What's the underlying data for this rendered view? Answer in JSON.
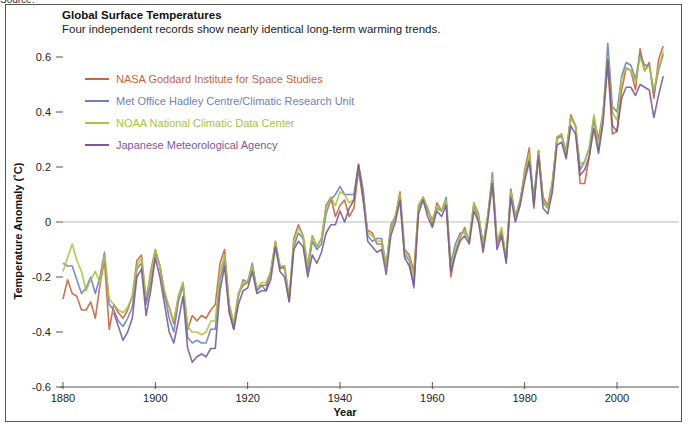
{
  "header": {
    "source_label": "Source:",
    "title": "Global Surface Temperatures",
    "subtitle": "Four independent records show nearly identical long-term warming trends."
  },
  "axes": {
    "xlabel": "Year",
    "ylabel": "Temperature Anomaly (˚C)"
  },
  "chart_data": {
    "type": "line",
    "title": "Global Surface Temperatures",
    "subtitle": "Four independent records show nearly identical long-term warming trends.",
    "xlabel": "Year",
    "ylabel": "Temperature Anomaly (˚C)",
    "xlim": [
      1880,
      2010
    ],
    "ylim": [
      -0.6,
      0.65
    ],
    "x_ticks": [
      1880,
      1900,
      1920,
      1940,
      1960,
      1980,
      2000
    ],
    "y_ticks": [
      -0.6,
      -0.4,
      -0.2,
      0,
      0.2,
      0.4,
      0.6
    ],
    "y_tick_labels": [
      "-0.6",
      "-0.4",
      "-0.2",
      "0",
      "0.2",
      "0.4",
      "0.6"
    ],
    "grid": false,
    "zero_line": true,
    "legend_position": "upper-left",
    "x": [
      1880,
      1881,
      1882,
      1883,
      1884,
      1885,
      1886,
      1887,
      1888,
      1889,
      1890,
      1891,
      1892,
      1893,
      1894,
      1895,
      1896,
      1897,
      1898,
      1899,
      1900,
      1901,
      1902,
      1903,
      1904,
      1905,
      1906,
      1907,
      1908,
      1909,
      1910,
      1911,
      1912,
      1913,
      1914,
      1915,
      1916,
      1917,
      1918,
      1919,
      1920,
      1921,
      1922,
      1923,
      1924,
      1925,
      1926,
      1927,
      1928,
      1929,
      1930,
      1931,
      1932,
      1933,
      1934,
      1935,
      1936,
      1937,
      1938,
      1939,
      1940,
      1941,
      1942,
      1943,
      1944,
      1945,
      1946,
      1947,
      1948,
      1949,
      1950,
      1951,
      1952,
      1953,
      1954,
      1955,
      1956,
      1957,
      1958,
      1959,
      1960,
      1961,
      1962,
      1963,
      1964,
      1965,
      1966,
      1967,
      1968,
      1969,
      1970,
      1971,
      1972,
      1973,
      1974,
      1975,
      1976,
      1977,
      1978,
      1979,
      1980,
      1981,
      1982,
      1983,
      1984,
      1985,
      1986,
      1987,
      1988,
      1989,
      1990,
      1991,
      1992,
      1993,
      1994,
      1995,
      1996,
      1997,
      1998,
      1999,
      2000,
      2001,
      2002,
      2003,
      2004,
      2005,
      2006,
      2007,
      2008,
      2009,
      2010
    ],
    "series": [
      {
        "name": "NASA Goddard Institute for Space Studies",
        "color": "#c8643c",
        "values": [
          -0.28,
          -0.21,
          -0.26,
          -0.27,
          -0.32,
          -0.32,
          -0.29,
          -0.35,
          -0.23,
          -0.14,
          -0.39,
          -0.3,
          -0.33,
          -0.35,
          -0.32,
          -0.27,
          -0.14,
          -0.12,
          -0.29,
          -0.18,
          -0.1,
          -0.16,
          -0.27,
          -0.31,
          -0.37,
          -0.27,
          -0.22,
          -0.39,
          -0.34,
          -0.36,
          -0.34,
          -0.35,
          -0.32,
          -0.3,
          -0.15,
          -0.1,
          -0.3,
          -0.37,
          -0.26,
          -0.23,
          -0.22,
          -0.16,
          -0.25,
          -0.23,
          -0.23,
          -0.18,
          -0.07,
          -0.17,
          -0.16,
          -0.28,
          -0.06,
          -0.01,
          -0.05,
          -0.16,
          -0.05,
          -0.09,
          -0.06,
          0.06,
          0.09,
          0.02,
          0.06,
          0.08,
          0.02,
          0.05,
          0.19,
          0.08,
          -0.03,
          -0.04,
          -0.08,
          -0.08,
          -0.16,
          -0.03,
          0.02,
          0.11,
          -0.1,
          -0.12,
          -0.18,
          0.06,
          0.09,
          0.05,
          -0.01,
          0.07,
          0.04,
          0.07,
          -0.2,
          -0.11,
          -0.06,
          -0.02,
          -0.07,
          0.07,
          0.03,
          -0.09,
          0.02,
          0.15,
          -0.08,
          -0.04,
          -0.13,
          0.12,
          0.02,
          0.06,
          0.19,
          0.27,
          0.05,
          0.26,
          0.09,
          0.06,
          0.15,
          0.3,
          0.32,
          0.24,
          0.39,
          0.35,
          0.14,
          0.14,
          0.24,
          0.38,
          0.3,
          0.4,
          0.57,
          0.32,
          0.33,
          0.48,
          0.56,
          0.55,
          0.48,
          0.63,
          0.55,
          0.58,
          0.45,
          0.59,
          0.64
        ]
      },
      {
        "name": "Met Office Hadley Centre/Climatic Research Unit",
        "color": "#6e7fc0",
        "values": [
          -0.15,
          -0.16,
          -0.16,
          -0.21,
          -0.26,
          -0.24,
          -0.2,
          -0.26,
          -0.2,
          -0.11,
          -0.3,
          -0.32,
          -0.36,
          -0.38,
          -0.35,
          -0.31,
          -0.17,
          -0.15,
          -0.3,
          -0.22,
          -0.11,
          -0.16,
          -0.26,
          -0.35,
          -0.4,
          -0.29,
          -0.23,
          -0.42,
          -0.44,
          -0.43,
          -0.44,
          -0.44,
          -0.39,
          -0.39,
          -0.21,
          -0.14,
          -0.32,
          -0.39,
          -0.27,
          -0.21,
          -0.22,
          -0.15,
          -0.25,
          -0.23,
          -0.25,
          -0.18,
          -0.08,
          -0.16,
          -0.17,
          -0.29,
          -0.09,
          -0.04,
          -0.06,
          -0.18,
          -0.07,
          -0.1,
          -0.08,
          0.03,
          0.08,
          0.1,
          0.13,
          0.1,
          0.1,
          0.1,
          0.21,
          0.12,
          -0.05,
          -0.07,
          -0.06,
          -0.06,
          -0.16,
          -0.01,
          0.02,
          0.09,
          -0.12,
          -0.14,
          -0.24,
          0.05,
          0.09,
          0.04,
          0.01,
          0.05,
          0.04,
          0.09,
          -0.15,
          -0.08,
          -0.04,
          -0.04,
          -0.06,
          0.06,
          0.01,
          -0.08,
          0.02,
          0.18,
          -0.07,
          -0.03,
          -0.14,
          0.11,
          0.02,
          0.08,
          0.17,
          0.23,
          0.09,
          0.26,
          0.07,
          0.05,
          0.13,
          0.31,
          0.31,
          0.26,
          0.38,
          0.35,
          0.19,
          0.22,
          0.27,
          0.38,
          0.26,
          0.39,
          0.65,
          0.42,
          0.4,
          0.53,
          0.58,
          0.57,
          0.52,
          0.61,
          0.57,
          0.57,
          0.47,
          0.55,
          0.61
        ]
      },
      {
        "name": "NOAA National Climatic Data Center",
        "color": "#a8c43c",
        "values": [
          -0.18,
          -0.13,
          -0.08,
          -0.14,
          -0.18,
          -0.25,
          -0.21,
          -0.18,
          -0.22,
          -0.12,
          -0.28,
          -0.3,
          -0.32,
          -0.33,
          -0.31,
          -0.27,
          -0.16,
          -0.13,
          -0.27,
          -0.2,
          -0.1,
          -0.16,
          -0.25,
          -0.31,
          -0.36,
          -0.27,
          -0.22,
          -0.38,
          -0.4,
          -0.4,
          -0.41,
          -0.4,
          -0.36,
          -0.36,
          -0.18,
          -0.12,
          -0.3,
          -0.37,
          -0.26,
          -0.22,
          -0.22,
          -0.16,
          -0.24,
          -0.22,
          -0.22,
          -0.18,
          -0.07,
          -0.16,
          -0.16,
          -0.28,
          -0.07,
          -0.02,
          -0.05,
          -0.16,
          -0.05,
          -0.09,
          -0.06,
          0.05,
          0.09,
          0.06,
          0.11,
          0.1,
          0.07,
          0.08,
          0.2,
          0.1,
          -0.04,
          -0.05,
          -0.07,
          -0.07,
          -0.16,
          -0.02,
          0.02,
          0.1,
          -0.11,
          -0.13,
          -0.2,
          0.06,
          0.09,
          0.05,
          0.0,
          0.06,
          0.04,
          0.08,
          -0.17,
          -0.1,
          -0.05,
          -0.03,
          -0.06,
          0.07,
          0.02,
          -0.08,
          0.02,
          0.16,
          -0.07,
          -0.02,
          -0.13,
          0.11,
          0.02,
          0.07,
          0.18,
          0.25,
          0.07,
          0.26,
          0.08,
          0.05,
          0.14,
          0.31,
          0.32,
          0.25,
          0.38,
          0.35,
          0.21,
          0.22,
          0.27,
          0.39,
          0.28,
          0.4,
          0.6,
          0.4,
          0.37,
          0.52,
          0.56,
          0.55,
          0.51,
          0.6,
          0.55,
          0.57,
          0.48,
          0.56,
          0.62
        ]
      },
      {
        "name": "Japanese Meteorological Agency",
        "color": "#7a5a96",
        "values": [
          null,
          null,
          null,
          null,
          null,
          null,
          null,
          null,
          null,
          null,
          null,
          -0.33,
          -0.38,
          -0.43,
          -0.4,
          -0.35,
          -0.2,
          -0.17,
          -0.34,
          -0.25,
          -0.13,
          -0.2,
          -0.3,
          -0.4,
          -0.44,
          -0.36,
          -0.27,
          -0.46,
          -0.51,
          -0.49,
          -0.48,
          -0.49,
          -0.46,
          -0.46,
          -0.25,
          -0.16,
          -0.33,
          -0.39,
          -0.3,
          -0.25,
          -0.24,
          -0.18,
          -0.26,
          -0.25,
          -0.25,
          -0.21,
          -0.09,
          -0.18,
          -0.2,
          -0.29,
          -0.1,
          -0.07,
          -0.09,
          -0.2,
          -0.12,
          -0.15,
          -0.11,
          -0.04,
          -0.01,
          -0.01,
          0.04,
          0.0,
          0.05,
          0.08,
          0.21,
          0.09,
          -0.07,
          -0.09,
          -0.11,
          -0.1,
          -0.19,
          -0.05,
          0.0,
          0.08,
          -0.13,
          -0.16,
          -0.23,
          0.03,
          0.08,
          0.02,
          -0.02,
          0.04,
          0.02,
          0.06,
          -0.18,
          -0.12,
          -0.07,
          -0.05,
          -0.08,
          0.04,
          0.0,
          -0.11,
          0.0,
          0.14,
          -0.1,
          -0.05,
          -0.15,
          0.09,
          0.0,
          0.06,
          0.15,
          0.22,
          0.06,
          0.24,
          0.05,
          0.03,
          0.11,
          0.28,
          0.29,
          0.23,
          0.35,
          0.32,
          0.17,
          0.19,
          0.24,
          0.34,
          0.25,
          0.36,
          0.59,
          0.35,
          0.33,
          0.45,
          0.49,
          0.49,
          0.46,
          0.5,
          0.49,
          0.48,
          0.38,
          0.46,
          0.53
        ]
      }
    ]
  },
  "legend": {
    "items": [
      {
        "label": "NASA Goddard Institute for Space Studies",
        "color": "#c8643c"
      },
      {
        "label": "Met Office Hadley Centre/Climatic Research Unit",
        "color": "#6e7fc0"
      },
      {
        "label": "NOAA National Climatic Data Center",
        "color": "#a8c43c"
      },
      {
        "label": "Japanese Meteorological Agency",
        "color": "#7a5a96"
      }
    ]
  }
}
